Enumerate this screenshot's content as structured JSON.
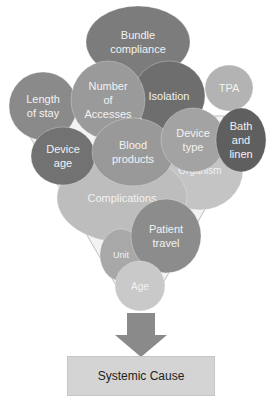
{
  "diagram": {
    "type": "funnel",
    "bubbles": [
      {
        "id": "bundle-compliance",
        "lines": [
          "Bundle",
          "compliance"
        ],
        "color": "#7c7c7c"
      },
      {
        "id": "organism",
        "lines": [
          "Organism"
        ],
        "color": "#c4c4c4"
      },
      {
        "id": "complications",
        "lines": [
          "Complications"
        ],
        "color": "#bdbdbd"
      },
      {
        "id": "isolation",
        "lines": [
          "Isolation"
        ],
        "color": "#6e6e6e"
      },
      {
        "id": "tpa",
        "lines": [
          "TPA"
        ],
        "color": "#b3b3b3"
      },
      {
        "id": "length-of-stay",
        "lines": [
          "Length",
          "of stay"
        ],
        "color": "#8a8a8a"
      },
      {
        "id": "number-of-accesses",
        "lines": [
          "Number",
          "of",
          "Accesses"
        ],
        "color": "#9a9a9a"
      },
      {
        "id": "device-age",
        "lines": [
          "Device",
          "age"
        ],
        "color": "#727272"
      },
      {
        "id": "blood-products",
        "lines": [
          "Blood",
          "products"
        ],
        "color": "#999999"
      },
      {
        "id": "device-type",
        "lines": [
          "Device",
          "type"
        ],
        "color": "#a3a3a3"
      },
      {
        "id": "bath-and-linen",
        "lines": [
          "Bath",
          "and",
          "linen"
        ],
        "color": "#5f5f5f"
      },
      {
        "id": "unit",
        "lines": [
          "Unit"
        ],
        "color": "#a8a8a8"
      },
      {
        "id": "patient-travel",
        "lines": [
          "Patient",
          "travel"
        ],
        "color": "#8c8c8c"
      },
      {
        "id": "age",
        "lines": [
          "Age"
        ],
        "color": "#c9c9c9"
      }
    ],
    "arrow_color": "#8a8a8a",
    "result_label": "Systemic Cause"
  }
}
